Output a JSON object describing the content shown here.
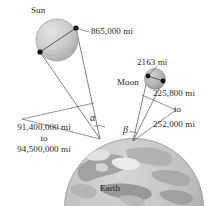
{
  "figure": {
    "type": "astronomy-scale-diagram",
    "caption_bodies": {
      "sun": "Sun",
      "moon": "Moon",
      "earth": "Earth"
    },
    "measurements": {
      "sun_diameter": "865,000 mi",
      "moon_diameter": "2163 mi",
      "sun_distance_line1": "91,400,000 mi",
      "sun_distance_conj": "to",
      "sun_distance_line2": "94,500,000 mi",
      "moon_distance_line1": "225,800 mi",
      "moon_distance_conj": "to",
      "moon_distance_line2": "252,000 mi"
    },
    "angles": {
      "sun_angle": "α",
      "moon_angle": "β"
    },
    "colors": {
      "sun_fill": "#c9c9c9",
      "moon_fill": "#b4b4b4",
      "earth_fill": "#c4c4c4",
      "line": "#4a4a4a",
      "dot": "#111111",
      "text": "#2b2b2b"
    }
  }
}
